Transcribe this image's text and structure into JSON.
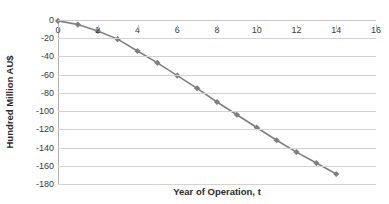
{
  "chart_data": {
    "type": "line",
    "title": "",
    "xlabel": "Year of Operation, t",
    "ylabel": "Hundred Million AU$",
    "xlim": [
      0,
      16
    ],
    "ylim": [
      -180,
      0
    ],
    "xticks": [
      0,
      2,
      4,
      6,
      8,
      10,
      12,
      14,
      16
    ],
    "xtick_labels": [
      "0",
      "2",
      "4",
      "6",
      "8",
      "10",
      "12",
      "14",
      "16"
    ],
    "yticks": [
      0,
      -20,
      -40,
      -60,
      -80,
      -100,
      -120,
      -140,
      -160,
      -180
    ],
    "ytick_labels": [
      "0",
      "-20",
      "-40",
      "-60",
      "-80",
      "-100",
      "-120",
      "-140",
      "-160",
      "-180"
    ],
    "grid": true,
    "legend": false,
    "marker": "diamond",
    "series_color": "#808080",
    "gridline_color": "#d3d3d3",
    "series": [
      {
        "name": "Cumulative value",
        "x": [
          0,
          1,
          2,
          3,
          4,
          5,
          6,
          7,
          8,
          9,
          10,
          11,
          12,
          13,
          14
        ],
        "values": [
          -1,
          -5,
          -12,
          -21,
          -34,
          -47,
          -61,
          -75,
          -90,
          -104,
          -118,
          -132,
          -145,
          -157,
          -169
        ]
      }
    ]
  },
  "axes": {
    "y_title": "Hundred Million AU$",
    "x_title": "Year of Operation, t"
  }
}
